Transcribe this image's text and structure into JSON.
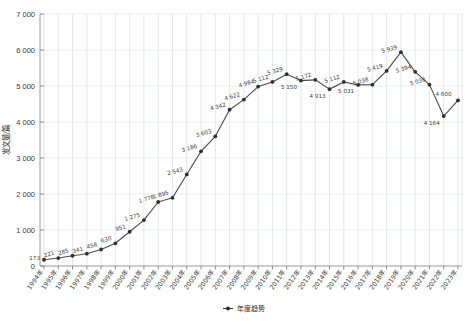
{
  "chart_data": {
    "type": "line",
    "title": "",
    "subtitle": "",
    "xlabel": "",
    "ylabel": "发文量/篇",
    "ylim": [
      0,
      7000
    ],
    "ytick_step": 1000,
    "ytick_labels": [
      "0",
      "1 000",
      "2 000",
      "3 000",
      "4 000",
      "5 000",
      "6 000",
      "7 000"
    ],
    "ytick_values": [
      0,
      1000,
      2000,
      3000,
      4000,
      5000,
      6000,
      7000
    ],
    "grid": true,
    "grid_axes": "both",
    "legend": [
      {
        "name": "年度趋势",
        "marker": "diamond-line",
        "color": "#3a3a3a"
      }
    ],
    "legend_position": "bottom-center",
    "marker_style": "filled-circle",
    "line_color": "#4d4d4d",
    "data_labels_shown": true,
    "categories": [
      "1994年",
      "1995年",
      "1996年",
      "1997年",
      "1998年",
      "1999年",
      "2000年",
      "2001年",
      "2002年",
      "2003年",
      "2004年",
      "2005年",
      "2006年",
      "2007年",
      "2008年",
      "2009年",
      "2010年",
      "2011年",
      "2012年",
      "2013年",
      "2014年",
      "2015年",
      "2016年",
      "2017年",
      "2018年",
      "2019年",
      "2020年",
      "2021年",
      "2022年",
      "2023年"
    ],
    "x": [
      1994,
      1995,
      1996,
      1997,
      1998,
      1999,
      2000,
      2001,
      2002,
      2003,
      2004,
      2005,
      2006,
      2007,
      2008,
      2009,
      2010,
      2011,
      2012,
      2013,
      2014,
      2015,
      2016,
      2017,
      2018,
      2019,
      2020,
      2021,
      2022,
      2023
    ],
    "values": [
      173,
      221,
      285,
      341,
      458,
      630,
      951,
      1275,
      1778,
      1895,
      2543,
      3186,
      3603,
      4342,
      4622,
      4984,
      5112,
      5329,
      5150,
      5172,
      4913,
      5112,
      5031,
      5038,
      5419,
      5939,
      5394,
      5038,
      4164,
      4600
    ],
    "value_labels": [
      "173",
      "221",
      "285",
      "341",
      "458",
      "630",
      "951",
      "1 275",
      "1 778",
      "1 895",
      "2 543",
      "3 186",
      "3 603",
      "4 342",
      "4 622",
      "4 984",
      "5 112",
      "5 329",
      "5 150",
      "5 172",
      "4 913",
      "5 112",
      "5 031",
      "5 038",
      "5 419",
      "5 939",
      "5 394",
      "5 038",
      "4 164",
      "4 600"
    ],
    "series": [
      {
        "name": "年度趋势",
        "values": [
          173,
          221,
          285,
          341,
          458,
          630,
          951,
          1275,
          1778,
          1895,
          2543,
          3186,
          3603,
          4342,
          4622,
          4984,
          5112,
          5329,
          5150,
          5172,
          4913,
          5112,
          5031,
          5038,
          5419,
          5939,
          5394,
          5038,
          4164,
          4600
        ]
      }
    ],
    "annotations": {
      "max_value": 5939,
      "max_category": "2019年",
      "min_value": 173,
      "min_category": "1994年"
    }
  },
  "colors": {
    "line": "#4d4d4d",
    "marker": "#2f2f2f",
    "grid": "#d8dbe0",
    "axis": "#9a9a9a",
    "text": "#3a3a3a",
    "background": "#ffffff"
  }
}
